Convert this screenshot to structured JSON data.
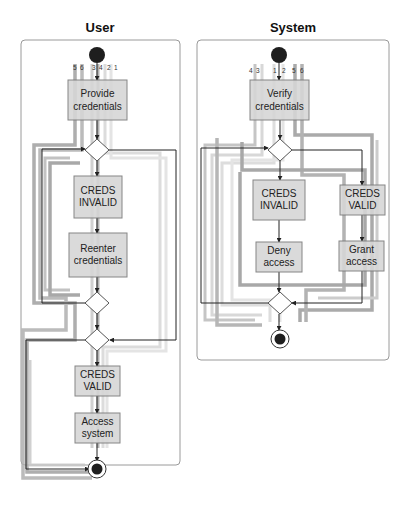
{
  "diagram": {
    "type": "UML activity diagram with swimlanes and highlighted flow paths",
    "lanes": [
      {
        "id": "user",
        "title": "User",
        "flow_labels": [
          "5",
          "6",
          "3",
          "4",
          "2",
          "1"
        ],
        "nodes": [
          {
            "id": "u_start",
            "kind": "initial"
          },
          {
            "id": "u_provide",
            "kind": "action",
            "lines": [
              "Provide",
              "credentials"
            ]
          },
          {
            "id": "u_d1",
            "kind": "decision"
          },
          {
            "id": "u_invalid",
            "kind": "action",
            "lines": [
              "CREDS",
              "INVALID"
            ]
          },
          {
            "id": "u_reenter",
            "kind": "action",
            "lines": [
              "Reenter",
              "credentials"
            ]
          },
          {
            "id": "u_d2",
            "kind": "decision"
          },
          {
            "id": "u_d3",
            "kind": "decision"
          },
          {
            "id": "u_valid",
            "kind": "action",
            "lines": [
              "CREDS",
              "VALID"
            ]
          },
          {
            "id": "u_access",
            "kind": "action",
            "lines": [
              "Access",
              "system"
            ]
          },
          {
            "id": "u_end",
            "kind": "final"
          }
        ]
      },
      {
        "id": "system",
        "title": "System",
        "flow_labels": [
          "4",
          "3",
          "1",
          "2",
          "5",
          "6"
        ],
        "nodes": [
          {
            "id": "s_start",
            "kind": "initial"
          },
          {
            "id": "s_verify",
            "kind": "action",
            "lines": [
              "Verify",
              "credentials"
            ]
          },
          {
            "id": "s_d1",
            "kind": "decision"
          },
          {
            "id": "s_invalid",
            "kind": "action",
            "lines": [
              "CREDS",
              "INVALID"
            ]
          },
          {
            "id": "s_valid",
            "kind": "action",
            "lines": [
              "CREDS",
              "VALID"
            ]
          },
          {
            "id": "s_deny",
            "kind": "action",
            "lines": [
              "Deny",
              "access"
            ]
          },
          {
            "id": "s_grant",
            "kind": "action",
            "lines": [
              "Grant",
              "access"
            ]
          },
          {
            "id": "s_d2",
            "kind": "decision"
          },
          {
            "id": "s_end",
            "kind": "final"
          }
        ]
      }
    ],
    "colors": {
      "action_fill": "#d6d6d6",
      "action_stroke": "#7a7a7a",
      "band_dark": "#9a9a9a",
      "band_mid": "#b5b5b5",
      "band_light": "#d2d2d2",
      "band_lighter": "#e3e3e3",
      "edge": "#222222",
      "node_dark": "#1e1e1e"
    }
  }
}
